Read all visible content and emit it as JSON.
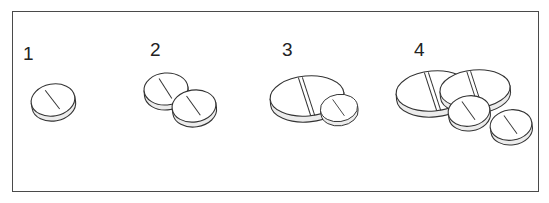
{
  "figure": {
    "panels": [
      {
        "label": "1",
        "description": "one small round scored tablet"
      },
      {
        "label": "2",
        "description": "two small round scored tablets"
      },
      {
        "label": "3",
        "description": "one large oval scored tablet and one small round tablet"
      },
      {
        "label": "4",
        "description": "two large oval scored tablets and two small round tablets"
      }
    ]
  },
  "colors": {
    "border": "#4a4a4a",
    "outline": "#333333",
    "tablet_side": "#ececec",
    "background": "#ffffff"
  }
}
